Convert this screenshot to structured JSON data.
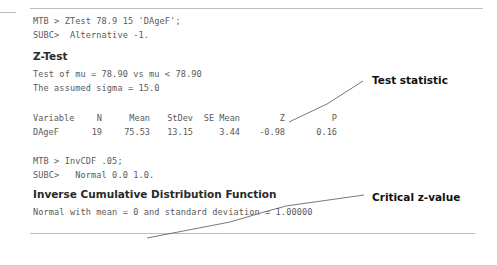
{
  "session": {
    "ztest_command": "MTB > ZTest 78.9 15 'DAgeF';",
    "ztest_subcommand": "SUBC>  Alternative -1.",
    "invcdf_command": "MTB > InvCDF .05;",
    "invcdf_subcommand": "SUBC>   Normal 0.0 1.0."
  },
  "ztest": {
    "title": "Z-Test",
    "hypothesis": "Test of mu = 78.90 vs mu < 78.90",
    "sigma_line": "The assumed sigma = 15.0",
    "table": {
      "headers": [
        "Variable",
        "N",
        "Mean",
        "StDev",
        "SE Mean",
        "Z",
        "P"
      ],
      "rows": [
        [
          "DAgeF",
          "19",
          "75.53",
          "13.15",
          "3.44",
          "-0.98",
          "0.16"
        ]
      ]
    }
  },
  "invcdf": {
    "title": "Inverse Cumulative Distribution Function",
    "description": "Normal with mean = 0 and standard deviation = 1.00000",
    "table": {
      "headers": [
        "P( X <= x)",
        "x"
      ],
      "rows": [
        [
          "0.0500",
          "-1.6449"
        ]
      ]
    }
  },
  "annotations": {
    "test_statistic": "Test statistic",
    "critical_value": "Critical z-value"
  }
}
